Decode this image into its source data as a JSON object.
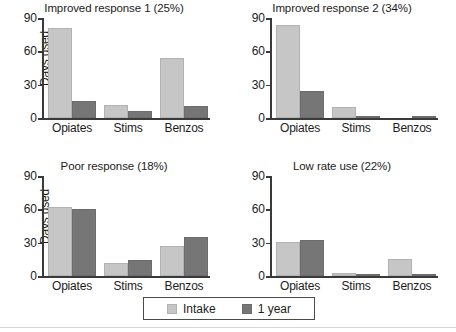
{
  "figure": {
    "ylabel": "Days used",
    "y_ticks": [
      0,
      30,
      60,
      90
    ],
    "ylim": [
      0,
      90
    ],
    "categories": [
      "Opiates",
      "Stims",
      "Benzos"
    ],
    "series_names": [
      "Intake",
      "1 year"
    ],
    "colors": {
      "intake": "#c6c6c6",
      "one_year": "#767676",
      "axis": "#3a3a3a",
      "text": "#1c1c1c"
    }
  },
  "legend": {
    "position": "bottom-center",
    "entries": [
      {
        "label": "Intake",
        "color": "#c6c6c6"
      },
      {
        "label": "1 year",
        "color": "#767676"
      }
    ]
  },
  "chart_data": [
    {
      "type": "bar",
      "title": "Improved response 1 (25%)",
      "xlabel": "",
      "ylabel": "Days used",
      "ylim": [
        0,
        90
      ],
      "y_ticks": [
        0,
        30,
        60,
        90
      ],
      "grid": false,
      "categories": [
        "Opiates",
        "Stims",
        "Benzos"
      ],
      "series": [
        {
          "name": "Intake",
          "values": [
            81,
            12,
            54
          ]
        },
        {
          "name": "1 year",
          "values": [
            15,
            6,
            11
          ]
        }
      ]
    },
    {
      "type": "bar",
      "title": "Improved response 2 (34%)",
      "xlabel": "",
      "ylabel": "",
      "ylim": [
        0,
        90
      ],
      "y_ticks": [
        0,
        30,
        60,
        90
      ],
      "grid": false,
      "categories": [
        "Opiates",
        "Stims",
        "Benzos"
      ],
      "series": [
        {
          "name": "Intake",
          "values": [
            84,
            10,
            0
          ]
        },
        {
          "name": "1 year",
          "values": [
            24,
            2,
            2
          ]
        }
      ]
    },
    {
      "type": "bar",
      "title": "Poor response (18%)",
      "xlabel": "",
      "ylabel": "Days used",
      "ylim": [
        0,
        90
      ],
      "y_ticks": [
        0,
        30,
        60,
        90
      ],
      "grid": false,
      "categories": [
        "Opiates",
        "Stims",
        "Benzos"
      ],
      "series": [
        {
          "name": "Intake",
          "values": [
            62,
            12,
            27
          ]
        },
        {
          "name": "1 year",
          "values": [
            60,
            14,
            35
          ]
        }
      ]
    },
    {
      "type": "bar",
      "title": "Low rate use (22%)",
      "xlabel": "",
      "ylabel": "",
      "ylim": [
        0,
        90
      ],
      "y_ticks": [
        0,
        30,
        60,
        90
      ],
      "grid": false,
      "categories": [
        "Opiates",
        "Stims",
        "Benzos"
      ],
      "series": [
        {
          "name": "Intake",
          "values": [
            31,
            3,
            15
          ]
        },
        {
          "name": "1 year",
          "values": [
            32,
            2,
            1
          ]
        }
      ]
    }
  ]
}
